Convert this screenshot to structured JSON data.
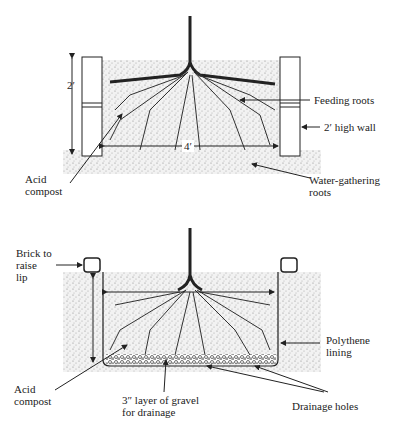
{
  "diagram_1": {
    "title": "Raised bed with walls",
    "labels": {
      "height": "2′",
      "width": "4′",
      "feeding_roots": "Feeding roots",
      "wall": "2′ high wall",
      "acid_compost": "Acid\ncompost",
      "water_roots": "Water-gathering\nroots"
    }
  },
  "diagram_2": {
    "title": "Sunken lined bed",
    "labels": {
      "brick": "Brick to\nraise\nlip",
      "polythene": "Polythene\nlining",
      "acid_compost": "Acid\ncompost",
      "gravel": "3″ layer of gravel\nfor drainage",
      "drainage_holes": "Drainage holes"
    }
  },
  "colors": {
    "ink": "#222222",
    "soil": "#e6e6e6",
    "compost": "#dcdcdc"
  }
}
